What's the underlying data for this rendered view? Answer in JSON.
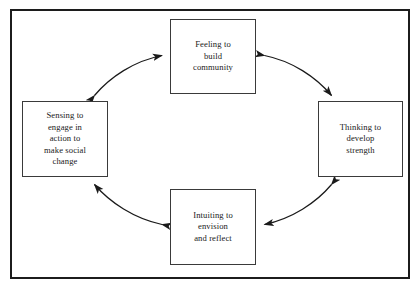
{
  "diagram": {
    "frame": {
      "border_color": "#1c1c1c",
      "background": "#ffffff"
    },
    "nodes": [
      {
        "id": "feeling",
        "position": "top",
        "label": "Feeling to\nbuild\ncommunity"
      },
      {
        "id": "thinking",
        "position": "right",
        "label": "Thinking to\ndevelop\nstrength"
      },
      {
        "id": "intuiting",
        "position": "bottom",
        "label": "Intuiting to\nenvision\nand reflect"
      },
      {
        "id": "sensing",
        "position": "left",
        "label": "Sensing to\nengage in\naction to\nmake social\nchange"
      }
    ],
    "connectors": [
      {
        "id": "feeling-thinking",
        "from": "feeling",
        "to": "thinking",
        "style": "curved double-headed arrow",
        "icon": "double-arrow-icon"
      },
      {
        "id": "thinking-intuiting",
        "from": "thinking",
        "to": "intuiting",
        "style": "curved double-headed arrow",
        "icon": "double-arrow-icon"
      },
      {
        "id": "intuiting-sensing",
        "from": "intuiting",
        "to": "sensing",
        "style": "curved double-headed arrow",
        "icon": "double-arrow-icon"
      },
      {
        "id": "sensing-feeling",
        "from": "sensing",
        "to": "feeling",
        "style": "curved double-headed arrow",
        "icon": "double-arrow-icon"
      }
    ],
    "colors": {
      "node_border": "#3a3a3a",
      "arrow": "#1a1a1a",
      "text": "#1a1a1a"
    }
  }
}
